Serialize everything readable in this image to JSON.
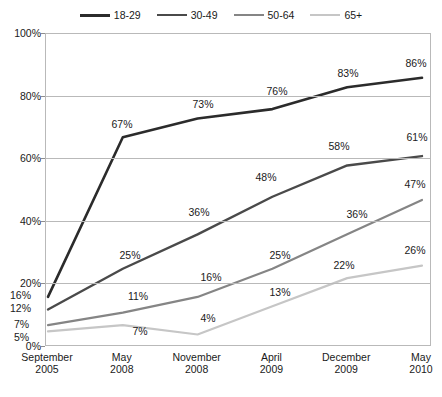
{
  "chart_data": {
    "type": "line",
    "title": "",
    "subtitle": "",
    "xlabel": "",
    "ylabel": "",
    "ylim": [
      0,
      100
    ],
    "yticks": [
      "0%",
      "20%",
      "40%",
      "60%",
      "80%",
      "100%"
    ],
    "ytick_values": [
      0,
      20,
      40,
      60,
      80,
      100
    ],
    "grid": "horizontal",
    "legend_position": "top-center",
    "value_suffix": "%",
    "categories": [
      "September\n2005",
      "May\n2008",
      "November\n2008",
      "April\n2009",
      "December\n2009",
      "May\n2010"
    ],
    "category_lines": [
      [
        "September",
        "2005"
      ],
      [
        "May",
        "2008"
      ],
      [
        "November",
        "2008"
      ],
      [
        "April",
        "2009"
      ],
      [
        "December",
        "2009"
      ],
      [
        "May",
        "2010"
      ]
    ],
    "series": [
      {
        "name": "18-29",
        "color": "#2b2b2b",
        "width": 2.6,
        "values": [
          16,
          67,
          73,
          76,
          83,
          86
        ],
        "labels": [
          "16%",
          "67%",
          "73%",
          "76%",
          "83%",
          "86%"
        ]
      },
      {
        "name": "30-49",
        "color": "#4a4a4a",
        "width": 2.4,
        "values": [
          12,
          25,
          36,
          48,
          58,
          61
        ],
        "labels": [
          "12%",
          "25%",
          "36%",
          "48%",
          "58%",
          "61%"
        ]
      },
      {
        "name": "50-64",
        "color": "#858585",
        "width": 2.2,
        "values": [
          7,
          11,
          16,
          25,
          36,
          47
        ],
        "labels": [
          "7%",
          "11%",
          "16%",
          "25%",
          "36%",
          "47%"
        ]
      },
      {
        "name": "65+",
        "color": "#c6c6c6",
        "width": 2.2,
        "values": [
          5,
          7,
          4,
          13,
          22,
          26
        ],
        "labels": [
          "5%",
          "7%",
          "4%",
          "13%",
          "22%",
          "26%"
        ]
      }
    ],
    "point_labels": [
      {
        "text": "16%",
        "x": 10,
        "y": 295,
        "anchor": "left"
      },
      {
        "text": "67%",
        "x": 122,
        "y": 124,
        "anchor": "mid"
      },
      {
        "text": "73%",
        "x": 203,
        "y": 104,
        "anchor": "mid"
      },
      {
        "text": "76%",
        "x": 277,
        "y": 91,
        "anchor": "mid"
      },
      {
        "text": "83%",
        "x": 348,
        "y": 73,
        "anchor": "mid"
      },
      {
        "text": "86%",
        "x": 416,
        "y": 63,
        "anchor": "mid"
      },
      {
        "text": "12%",
        "x": 10,
        "y": 308,
        "anchor": "left"
      },
      {
        "text": "25%",
        "x": 130,
        "y": 255,
        "anchor": "mid"
      },
      {
        "text": "36%",
        "x": 199,
        "y": 212,
        "anchor": "mid"
      },
      {
        "text": "48%",
        "x": 266,
        "y": 177,
        "anchor": "mid"
      },
      {
        "text": "58%",
        "x": 339,
        "y": 146,
        "anchor": "mid"
      },
      {
        "text": "61%",
        "x": 417,
        "y": 137,
        "anchor": "mid"
      },
      {
        "text": "7%",
        "x": 14,
        "y": 324,
        "anchor": "left"
      },
      {
        "text": "11%",
        "x": 138,
        "y": 296,
        "anchor": "mid"
      },
      {
        "text": "16%",
        "x": 211,
        "y": 277,
        "anchor": "mid"
      },
      {
        "text": "25%",
        "x": 280,
        "y": 255,
        "anchor": "mid"
      },
      {
        "text": "36%",
        "x": 357,
        "y": 214,
        "anchor": "mid"
      },
      {
        "text": "47%",
        "x": 415,
        "y": 184,
        "anchor": "mid"
      },
      {
        "text": "5%",
        "x": 14,
        "y": 337,
        "anchor": "left"
      },
      {
        "text": "7%",
        "x": 140,
        "y": 331,
        "anchor": "mid"
      },
      {
        "text": "4%",
        "x": 208,
        "y": 318,
        "anchor": "mid"
      },
      {
        "text": "13%",
        "x": 280,
        "y": 292,
        "anchor": "mid"
      },
      {
        "text": "22%",
        "x": 344,
        "y": 265,
        "anchor": "mid"
      },
      {
        "text": "26%",
        "x": 415,
        "y": 250,
        "anchor": "mid"
      }
    ]
  }
}
